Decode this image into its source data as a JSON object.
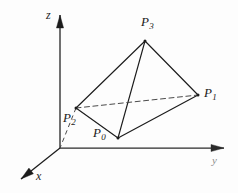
{
  "figure": {
    "background_color": "#fdfdfd",
    "stroke_color": "#1c1c1c",
    "dashed_color": "#4a4a4a",
    "axis_color": "#1c1c1c",
    "width": 238,
    "height": 193
  },
  "axes": {
    "origin": {
      "x": 60,
      "y": 148
    },
    "items": [
      {
        "name": "z",
        "label": "z",
        "label_x": 46,
        "label_y": 9,
        "from": {
          "x": 60,
          "y": 148
        },
        "to": {
          "x": 60,
          "y": 15
        },
        "arrow": "up"
      },
      {
        "name": "y",
        "label": "y",
        "label_x": 212,
        "label_y": 155,
        "from": {
          "x": 60,
          "y": 148
        },
        "to": {
          "x": 224,
          "y": 148
        },
        "arrow": "right",
        "faint": true
      },
      {
        "name": "x",
        "label": "x",
        "label_x": 36,
        "label_y": 170,
        "from": {
          "x": 60,
          "y": 148
        },
        "to": {
          "x": 21,
          "y": 179
        },
        "arrow": "down-left"
      }
    ]
  },
  "vertices": [
    {
      "id": "P0",
      "base": "P",
      "sub": "0",
      "x": 118,
      "y": 138,
      "label_x": 93,
      "label_y": 126
    },
    {
      "id": "P1",
      "base": "P",
      "sub": "1",
      "x": 198,
      "y": 95,
      "label_x": 204,
      "label_y": 86
    },
    {
      "id": "P2",
      "base": "P",
      "sub": "2",
      "x": 76,
      "y": 108,
      "label_x": 63,
      "label_y": 111
    },
    {
      "id": "P3",
      "base": "P",
      "sub": "3",
      "x": 145,
      "y": 41,
      "label_x": 141,
      "label_y": 15
    }
  ],
  "edges": [
    {
      "from": "P3",
      "to": "P2",
      "style": "solid",
      "hidden": false
    },
    {
      "from": "P3",
      "to": "P0",
      "style": "solid",
      "hidden": false
    },
    {
      "from": "P3",
      "to": "P1",
      "style": "solid",
      "hidden": false
    },
    {
      "from": "P2",
      "to": "P0",
      "style": "solid",
      "hidden": false
    },
    {
      "from": "P0",
      "to": "P1",
      "style": "solid",
      "hidden": false
    },
    {
      "from": "P2",
      "to": "P1",
      "style": "dashed",
      "hidden": true
    }
  ],
  "projection_lines": [
    {
      "name": "p2-to-origin",
      "from": {
        "x": 76,
        "y": 108
      },
      "to": {
        "x": 60,
        "y": 148
      },
      "style": "dashed"
    }
  ]
}
